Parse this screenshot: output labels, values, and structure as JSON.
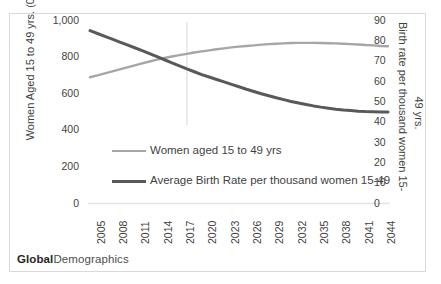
{
  "card": {
    "watermark_bold": "Global",
    "watermark_rest": "Demographics",
    "border_color": "#d9d9d9",
    "background": "#ffffff"
  },
  "axes": {
    "left": {
      "title": "Women Aged 15 to 49 yrs. (000s)",
      "ticks": [
        "1,000",
        "800",
        "600",
        "400",
        "200",
        "0"
      ],
      "min": 0,
      "max": 1000,
      "step": 200
    },
    "right": {
      "title_line1": "Birth rate per thousand women 15-",
      "title_line2": "49 yrs.",
      "ticks": [
        "90",
        "80",
        "70",
        "60",
        "50",
        "40",
        "30",
        "20",
        "10",
        "0"
      ],
      "min": 0,
      "max": 90,
      "step": 10
    },
    "x": {
      "ticks": [
        "2005",
        "2008",
        "2011",
        "2014",
        "2017",
        "2020",
        "2023",
        "2026",
        "2029",
        "2032",
        "2035",
        "2038",
        "2041",
        "2044"
      ],
      "min": 2005,
      "max": 2045
    }
  },
  "legend": [
    {
      "label": "Women aged 15 to 49 yrs",
      "color": "#a6a6a6",
      "width": 2.4
    },
    {
      "label": "Average Birth Rate per thousand women 15-49",
      "color": "#595959",
      "width": 3.0
    }
  ],
  "chart_data": {
    "type": "line",
    "title": "",
    "xlabel": "",
    "ylabel": "Women Aged 15 to 49 yrs. (000s)",
    "y2label": "Birth rate per thousand women 15-49 yrs.",
    "ylim": [
      0,
      1000
    ],
    "y2lim": [
      0,
      90
    ],
    "xlim": [
      2005,
      2045
    ],
    "grid": false,
    "legend_position": "inside-center",
    "reference_line": {
      "x": 2018,
      "color": "#e3e3e3"
    },
    "x": [
      2005,
      2006,
      2007,
      2008,
      2009,
      2010,
      2011,
      2012,
      2013,
      2014,
      2015,
      2016,
      2017,
      2018,
      2019,
      2020,
      2021,
      2022,
      2023,
      2024,
      2025,
      2026,
      2027,
      2028,
      2029,
      2030,
      2031,
      2032,
      2033,
      2034,
      2035,
      2036,
      2037,
      2038,
      2039,
      2040,
      2041,
      2042,
      2043,
      2044,
      2045
    ],
    "series": [
      {
        "name": "Women aged 15 to 49 yrs",
        "axis": "left",
        "units": "thousands",
        "color": "#a6a6a6",
        "values": [
          690,
          700,
          711,
          722,
          733,
          744,
          755,
          766,
          776,
          786,
          795,
          803,
          811,
          818,
          825,
          831,
          837,
          843,
          848,
          853,
          857,
          861,
          864,
          868,
          871,
          873,
          875,
          877,
          878,
          878,
          878,
          877,
          876,
          875,
          873,
          871,
          869,
          866,
          864,
          861,
          859
        ]
      },
      {
        "name": "Average Birth Rate per thousand women 15-49",
        "axis": "right",
        "units": "births per thousand women",
        "color": "#595959",
        "values": [
          85.0,
          83.6,
          82.2,
          80.8,
          79.4,
          78.0,
          76.6,
          75.2,
          73.7,
          72.2,
          70.7,
          69.2,
          67.7,
          66.2,
          64.8,
          63.4,
          62.2,
          61.0,
          59.8,
          58.6,
          57.4,
          56.2,
          55.1,
          54.0,
          53.0,
          52.0,
          51.1,
          50.2,
          49.4,
          48.7,
          48.0,
          47.4,
          46.9,
          46.4,
          46.0,
          45.7,
          45.4,
          45.2,
          45.1,
          45.0,
          45.0
        ]
      }
    ]
  }
}
